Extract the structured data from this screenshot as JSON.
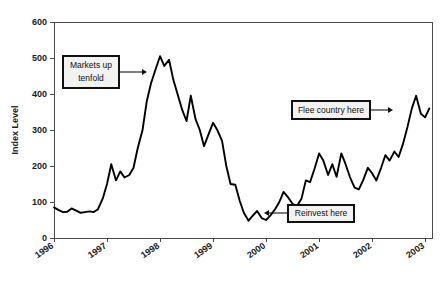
{
  "chart_data": {
    "type": "line",
    "title": "",
    "xlabel": "",
    "ylabel": "Index Level",
    "ylim": [
      0,
      600
    ],
    "xlim": [
      1996,
      2003.13
    ],
    "grid": false,
    "legend": null,
    "y_ticks": [
      0,
      100,
      200,
      300,
      400,
      500,
      600
    ],
    "x_ticks": [
      1996,
      1997,
      1998,
      1999,
      2000,
      2001,
      2002,
      2003
    ],
    "x_tick_labels": [
      "1996",
      "1997",
      "1998",
      "1999",
      "2000",
      "2001",
      "2002",
      "2003"
    ],
    "y_tick_labels": [
      "0",
      "100",
      "200",
      "300",
      "400",
      "500",
      "600"
    ],
    "line_color": "#000000",
    "series": [
      {
        "name": "Index Level",
        "x": [
          1996.0,
          1996.08,
          1996.17,
          1996.25,
          1996.33,
          1996.42,
          1996.5,
          1996.58,
          1996.67,
          1996.75,
          1996.83,
          1996.92,
          1997.0,
          1997.08,
          1997.17,
          1997.25,
          1997.33,
          1997.42,
          1997.5,
          1997.58,
          1997.67,
          1997.75,
          1997.83,
          1997.92,
          1998.0,
          1998.08,
          1998.17,
          1998.25,
          1998.33,
          1998.42,
          1998.5,
          1998.58,
          1998.67,
          1998.75,
          1998.83,
          1998.92,
          1999.0,
          1999.08,
          1999.17,
          1999.25,
          1999.33,
          1999.42,
          1999.5,
          1999.58,
          1999.67,
          1999.75,
          1999.83,
          1999.92,
          2000.0,
          2000.08,
          2000.17,
          2000.25,
          2000.33,
          2000.42,
          2000.5,
          2000.58,
          2000.67,
          2000.75,
          2000.83,
          2000.92,
          2001.0,
          2001.08,
          2001.17,
          2001.25,
          2001.33,
          2001.42,
          2001.5,
          2001.58,
          2001.67,
          2001.75,
          2001.83,
          2001.92,
          2002.0,
          2002.08,
          2002.17,
          2002.25,
          2002.33,
          2002.42,
          2002.5,
          2002.58,
          2002.67,
          2002.75,
          2002.83,
          2002.92,
          2003.0,
          2003.08
        ],
        "values": [
          85,
          78,
          72,
          73,
          82,
          76,
          70,
          72,
          74,
          72,
          80,
          110,
          150,
          205,
          160,
          185,
          168,
          175,
          195,
          250,
          300,
          380,
          430,
          470,
          505,
          478,
          495,
          440,
          400,
          355,
          325,
          395,
          330,
          300,
          255,
          290,
          320,
          300,
          270,
          200,
          150,
          148,
          105,
          70,
          48,
          62,
          75,
          55,
          50,
          62,
          80,
          100,
          128,
          112,
          95,
          88,
          110,
          160,
          155,
          195,
          235,
          215,
          175,
          205,
          170,
          235,
          205,
          170,
          140,
          135,
          160,
          195,
          180,
          160,
          195,
          230,
          215,
          240,
          225,
          260,
          310,
          360,
          395,
          345,
          335,
          360
        ]
      }
    ],
    "annotations": [
      {
        "id": "markets-up-tenfold",
        "text": "Markets up\ntenfold",
        "line1": "Markets up",
        "line2": "tenfold",
        "box_x": 63,
        "box_y": 56,
        "box_w": 56,
        "box_h": 32,
        "arrow_from_x": 119,
        "arrow_to_x": 147,
        "arrow_y": 72
      },
      {
        "id": "flee-country-here",
        "text": "Flee country here",
        "line1": "Flee country here",
        "line2": "",
        "box_x": 292,
        "box_y": 101,
        "box_w": 78,
        "box_h": 18,
        "arrow_from_x": 370,
        "arrow_to_x": 393,
        "arrow_y": 110
      },
      {
        "id": "reinvest-here",
        "text": "Reinvest here",
        "line1": "Reinvest here",
        "line2": "",
        "box_x": 288,
        "box_y": 205,
        "box_w": 66,
        "box_h": 17,
        "arrow_from_x": 288,
        "arrow_to_x": 264,
        "arrow_y": 213
      }
    ]
  },
  "plot": {
    "left": 54,
    "right": 432,
    "top": 22,
    "bottom": 238
  }
}
